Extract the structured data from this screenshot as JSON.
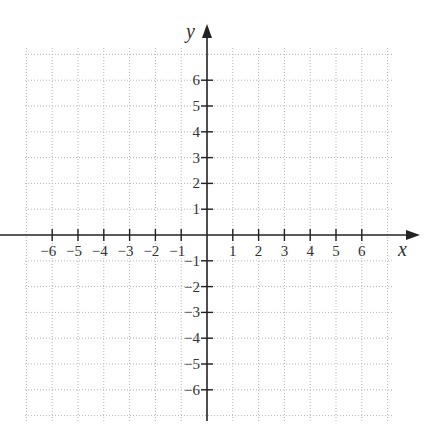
{
  "chart_data": {
    "type": "scatter",
    "title": "",
    "xlabel": "x",
    "ylabel": "y",
    "xlim": [
      -7,
      7
    ],
    "ylim": [
      -7,
      7
    ],
    "grid": true,
    "x_ticks": [
      -6,
      -5,
      -4,
      -3,
      -2,
      -1,
      1,
      2,
      3,
      4,
      5,
      6
    ],
    "y_ticks": [
      6,
      5,
      4,
      3,
      2,
      1,
      -1,
      -2,
      -3,
      -4,
      -5,
      -6
    ],
    "x_tick_labels": [
      "−6",
      "−5",
      "−4",
      "−3",
      "−2",
      "−1",
      "1",
      "2",
      "3",
      "4",
      "5",
      "6"
    ],
    "y_tick_labels": [
      "6",
      "5",
      "4",
      "3",
      "2",
      "1",
      "−1",
      "−2",
      "−3",
      "−4",
      "−5",
      "−6"
    ],
    "series": []
  },
  "labels": {
    "x_axis": "x",
    "y_axis": "y"
  }
}
